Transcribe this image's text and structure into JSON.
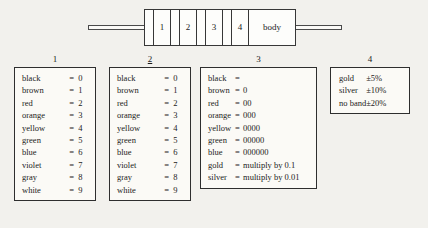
{
  "diagram": {
    "name": "resistor-with-four-color-bands",
    "bands": [
      "1",
      "2",
      "3",
      "4"
    ],
    "body_label": "body",
    "lead_left": "",
    "lead_right": ""
  },
  "tables": [
    {
      "caption": "1",
      "caption_underlined": false,
      "columns": [
        "color",
        "equals",
        "value"
      ],
      "rows": [
        [
          "black",
          "=",
          "0"
        ],
        [
          "brown",
          "=",
          "1"
        ],
        [
          "red",
          "=",
          "2"
        ],
        [
          "orange",
          "=",
          "3"
        ],
        [
          "yellow",
          "=",
          "4"
        ],
        [
          "green",
          "=",
          "5"
        ],
        [
          "blue",
          "=",
          "6"
        ],
        [
          "violet",
          "=",
          "7"
        ],
        [
          "gray",
          "=",
          "8"
        ],
        [
          "white",
          "=",
          "9"
        ]
      ]
    },
    {
      "caption": "2",
      "caption_underlined": true,
      "columns": [
        "color",
        "equals",
        "value"
      ],
      "rows": [
        [
          "black",
          "=",
          "0"
        ],
        [
          "brown",
          "=",
          "1"
        ],
        [
          "red",
          "=",
          "2"
        ],
        [
          "orange",
          "=",
          "3"
        ],
        [
          "yellow",
          "=",
          "4"
        ],
        [
          "green",
          "=",
          "5"
        ],
        [
          "blue",
          "=",
          "6"
        ],
        [
          "violet",
          "=",
          "7"
        ],
        [
          "gray",
          "=",
          "8"
        ],
        [
          "white",
          "=",
          "9"
        ]
      ]
    },
    {
      "caption": "3",
      "caption_underlined": false,
      "columns": [
        "color",
        "equals",
        "multiplier"
      ],
      "rows": [
        [
          "black",
          "=",
          ""
        ],
        [
          "brown",
          "=",
          "0"
        ],
        [
          "red",
          "=",
          "00"
        ],
        [
          "orange",
          "=",
          "000"
        ],
        [
          "yellow",
          "=",
          "0000"
        ],
        [
          "green",
          "=",
          "00000"
        ],
        [
          "blue",
          "=",
          "000000"
        ],
        [
          "gold",
          "=",
          "multiply by 0.1"
        ],
        [
          "silver",
          "=",
          "multiply by 0.01"
        ]
      ]
    },
    {
      "caption": "4",
      "caption_underlined": false,
      "columns": [
        "color",
        "tolerance"
      ],
      "rows": [
        [
          "gold",
          "±5%"
        ],
        [
          "silver",
          "±10%"
        ],
        [
          "no band",
          "±20%"
        ]
      ]
    }
  ],
  "colors": {
    "page_background": "#f2f1ed",
    "ink": "#1b1b1b",
    "box_border": "#2e2e2e",
    "box_fill": "#fbfaf6"
  }
}
